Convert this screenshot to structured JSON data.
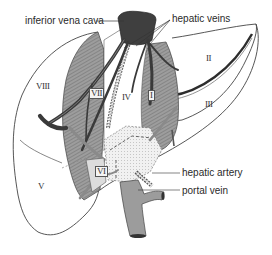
{
  "diagram": {
    "labels": {
      "ivc": "inferior vena cava",
      "hepatic_veins": "hepatic veins",
      "hepatic_artery": "hepatic artery",
      "portal_vein": "portal vein"
    },
    "segments": {
      "s1": "I",
      "s2": "II",
      "s3": "III",
      "s4": "IV",
      "s5": "V",
      "s6": "VI",
      "s7": "VII",
      "s8": "VIII"
    },
    "colors": {
      "vessel_dark": "#3c3c3c",
      "vessel_mid": "#8a8a8a",
      "parenchyma_shade": "#9a9a9a",
      "outline": "#444444",
      "text": "#2a2a2a"
    }
  }
}
